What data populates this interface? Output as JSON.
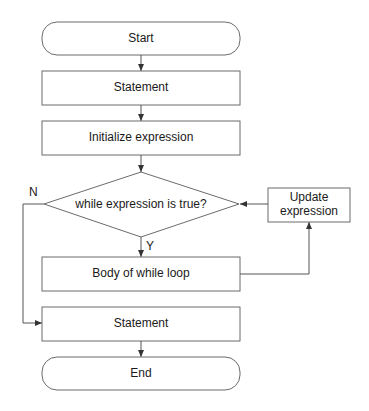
{
  "diagram": {
    "type": "flowchart",
    "nodes": {
      "start": {
        "label": "Start",
        "shape": "terminal"
      },
      "statement1": {
        "label": "Statement",
        "shape": "process"
      },
      "init": {
        "label": "Initialize expression",
        "shape": "process"
      },
      "condition": {
        "label": "while expression is true?",
        "shape": "decision"
      },
      "update_line1": {
        "label": "Update",
        "shape": "process"
      },
      "update_line2": {
        "label": "expression",
        "shape": "process"
      },
      "body": {
        "label": "Body of while loop",
        "shape": "process"
      },
      "statement2": {
        "label": "Statement",
        "shape": "process"
      },
      "end": {
        "label": "End",
        "shape": "terminal"
      }
    },
    "branches": {
      "yes": "Y",
      "no": "N"
    },
    "edges": [
      {
        "from": "start",
        "to": "statement1"
      },
      {
        "from": "statement1",
        "to": "init"
      },
      {
        "from": "init",
        "to": "condition"
      },
      {
        "from": "condition",
        "to": "body",
        "label": "Y"
      },
      {
        "from": "condition",
        "to": "statement2",
        "label": "N"
      },
      {
        "from": "body",
        "to": "update"
      },
      {
        "from": "update",
        "to": "condition"
      },
      {
        "from": "statement2",
        "to": "end"
      }
    ],
    "colors": {
      "stroke": "#6b6b6b",
      "fill": "#ffffff",
      "text": "#1a1a1a"
    }
  }
}
